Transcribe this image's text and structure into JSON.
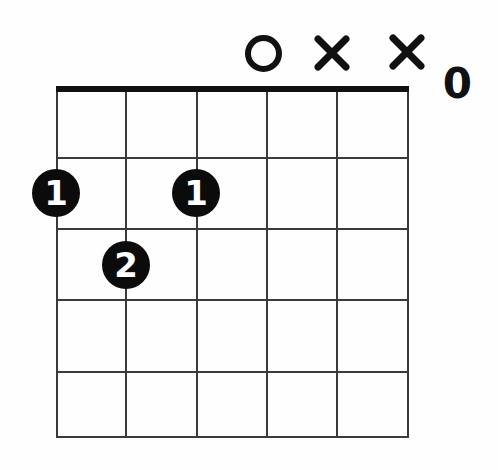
{
  "diagram": {
    "background_color": "#fefefe",
    "ink_color": "#111111",
    "grid_line_color": "#3a3a3a",
    "dot_color": "#0b0b0b",
    "dot_text_color": "#ffffff",
    "string_count": 6,
    "fret_count": 5
  },
  "grid": {
    "left": 57,
    "right": 408,
    "nut_y": 86,
    "nut_thickness": 6,
    "bottom": 437,
    "string_x": [
      57,
      126,
      197,
      267,
      337,
      408
    ],
    "fret_y": [
      158,
      229,
      300,
      372,
      437
    ]
  },
  "top_markers": [
    {
      "id": "open-string-3",
      "symbol": "O",
      "type": "open",
      "string_index": 3,
      "x": 263,
      "y": 53,
      "size": 37
    },
    {
      "id": "muted-string-2",
      "symbol": "X",
      "type": "mute",
      "string_index": 4,
      "x": 332,
      "y": 53,
      "size": 36
    },
    {
      "id": "muted-string-1",
      "symbol": "X",
      "type": "mute",
      "string_index": 5,
      "x": 407,
      "y": 52,
      "size": 36
    }
  ],
  "open_zero": {
    "label": "0",
    "x": 457,
    "y": 85,
    "font_size": 42
  },
  "finger_dots": [
    {
      "id": "dot-string6-fret2",
      "label": "1",
      "string_index": 0,
      "fret": 2,
      "cx": 56,
      "cy": 193,
      "radius": 24,
      "font_size": 34
    },
    {
      "id": "dot-string5-fret3",
      "label": "2",
      "string_index": 1,
      "fret": 3,
      "cx": 126,
      "cy": 265,
      "radius": 24,
      "font_size": 34
    },
    {
      "id": "dot-string3-fret2",
      "label": "1",
      "string_index": 2,
      "fret": 2,
      "cx": 196,
      "cy": 193,
      "radius": 24,
      "font_size": 34
    }
  ]
}
